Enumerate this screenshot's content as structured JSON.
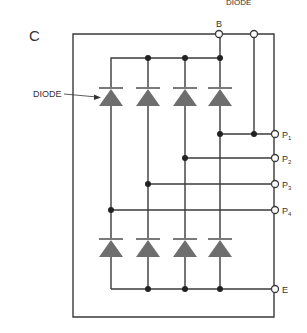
{
  "figure": {
    "panel_label": "C",
    "top_faint_label": "DIODE",
    "callout_label": "DIODE",
    "terminals": {
      "B": "B",
      "P1": {
        "main": "P",
        "sub": "1"
      },
      "P2": {
        "main": "P",
        "sub": "2"
      },
      "P3": {
        "main": "P",
        "sub": "3"
      },
      "P4": {
        "main": "P",
        "sub": "4"
      },
      "E": "E"
    },
    "diode_count_top": 4,
    "diode_count_bottom": 4,
    "colors": {
      "wire": "#3a3a3a",
      "diode_fill": "#6e6e6e",
      "diode_bar": "#7a7a7a"
    }
  }
}
